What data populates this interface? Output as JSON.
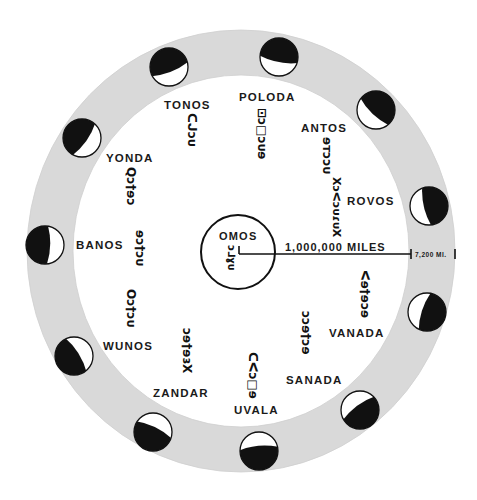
{
  "diagram": {
    "center_body": {
      "label": "OMOS",
      "glyph": "ɔ⅃ɣᴜ"
    },
    "scale": {
      "main_label": "1,000,000 MILES",
      "ring_label": "7,200 MI."
    },
    "colors": {
      "ring": "#d9d9d9",
      "ink": "#111111",
      "background": "#ffffff",
      "lit": "#ffffff"
    },
    "planets": [
      {
        "name": "TONOS",
        "glyph": "ᑕᒍɔᴜ"
      },
      {
        "name": "POLODA",
        "glyph": "⊡ɔ□ɔᴜɘ"
      },
      {
        "name": "ANTOS",
        "glyph": "ɘᴛɔɔᴜ"
      },
      {
        "name": "ROVOS",
        "glyph": "ХɔᐸɔᴜɾᴜХ"
      },
      {
        "name": "YONDA",
        "glyph": "Qɔ†ɘɔ"
      },
      {
        "name": "BANOS",
        "glyph": "ɘɔ†ɔᴜ"
      },
      {
        "name": "WUNOS",
        "glyph": "Oɔ†ɔᴜ"
      },
      {
        "name": "ZANDAR",
        "glyph": "ɔɘ†ɘɜX"
      },
      {
        "name": "UVALA",
        "glyph": "ᑕᐸɔ□ɘ"
      },
      {
        "name": "SANADA",
        "glyph": "ɔɔɘ†ɔɘ"
      },
      {
        "name": "VANADA",
        "glyph": "ᐸɘ†ɘɔɘ"
      }
    ],
    "moons": [
      {
        "id": "top-left",
        "cx": 169,
        "cy": 67
      },
      {
        "id": "top",
        "cx": 279,
        "cy": 57
      },
      {
        "id": "upper-right",
        "cx": 376,
        "cy": 110
      },
      {
        "id": "right-upper",
        "cx": 429,
        "cy": 206
      },
      {
        "id": "right-lower",
        "cx": 427,
        "cy": 312
      },
      {
        "id": "lower-right",
        "cx": 360,
        "cy": 410
      },
      {
        "id": "bottom",
        "cx": 259,
        "cy": 451
      },
      {
        "id": "lower-left",
        "cx": 153,
        "cy": 432
      },
      {
        "id": "left-lower",
        "cx": 74,
        "cy": 356
      },
      {
        "id": "left",
        "cx": 45,
        "cy": 245
      },
      {
        "id": "upper-left",
        "cx": 82,
        "cy": 138
      }
    ]
  }
}
